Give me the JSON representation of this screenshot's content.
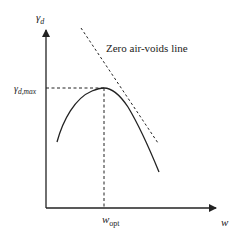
{
  "diagram": {
    "type": "compaction-curve",
    "y_axis_label": "γ",
    "y_axis_label_sub": "d",
    "y_max_label": "γ",
    "y_max_label_sub": "d,max",
    "x_axis_label": "w",
    "x_opt_label": "w",
    "x_opt_label_sub": "opt",
    "zav_label": "Zero air-voids line",
    "colors": {
      "line": "#222222",
      "background": "#ffffff"
    },
    "curve": {
      "description": "Compaction curve: dry unit weight vs moisture content, peak at (w_opt, γd,max)",
      "points": [
        [
          57,
          142
        ],
        [
          66,
          122
        ],
        [
          76,
          105
        ],
        [
          88,
          93
        ],
        [
          104,
          88
        ],
        [
          116,
          93
        ],
        [
          128,
          108
        ],
        [
          140,
          130
        ],
        [
          150,
          150
        ],
        [
          159,
          172
        ]
      ]
    },
    "zero_air_voids_line": {
      "from": [
        81,
        28
      ],
      "to": [
        158,
        143
      ]
    },
    "peak": [
      104,
      88
    ]
  }
}
